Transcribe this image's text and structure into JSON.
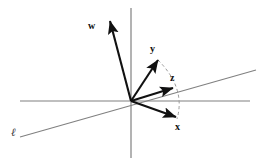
{
  "figure": {
    "width": 265,
    "height": 166,
    "background": "#ffffff",
    "origin": {
      "x": 131,
      "y": 101
    },
    "axis_color": "#808080",
    "vector_color": "#111111",
    "dashed_color": "#999999"
  },
  "axes": {
    "horizontal": {
      "name": "horizontal-axis",
      "x1": 20,
      "y1": 101,
      "x2": 250,
      "y2": 101
    },
    "vertical": {
      "name": "vertical-axis",
      "x1": 131,
      "y1": 8,
      "x2": 131,
      "y2": 158
    },
    "oblique": {
      "name": "oblique-line",
      "x1": 20,
      "y1": 137,
      "x2": 256,
      "y2": 70
    }
  },
  "vectors": [
    {
      "id": "w",
      "label": "w",
      "tail": {
        "x": 131,
        "y": 101
      },
      "tip": {
        "x": 110,
        "y": 21
      },
      "label_pos": {
        "x": 88,
        "y": 21
      }
    },
    {
      "id": "y",
      "label": "y",
      "tail": {
        "x": 131,
        "y": 101
      },
      "tip": {
        "x": 158,
        "y": 60
      },
      "label_pos": {
        "x": 150,
        "y": 44
      }
    },
    {
      "id": "z",
      "label": "z",
      "tail": {
        "x": 131,
        "y": 101
      },
      "tip": {
        "x": 173,
        "y": 88
      },
      "label_pos": {
        "x": 170,
        "y": 73
      }
    },
    {
      "id": "x",
      "label": "x",
      "tail": {
        "x": 131,
        "y": 101
      },
      "tip": {
        "x": 176,
        "y": 117
      },
      "label_pos": {
        "x": 175,
        "y": 122
      }
    }
  ],
  "dashed_arc": {
    "name": "projection-arc",
    "start": {
      "x": 158,
      "y": 60
    },
    "control": {
      "x": 186,
      "y": 88
    },
    "end": {
      "x": 177,
      "y": 119
    }
  },
  "line_label": {
    "text": "ℓ",
    "pos": {
      "x": 11,
      "y": 127
    }
  }
}
